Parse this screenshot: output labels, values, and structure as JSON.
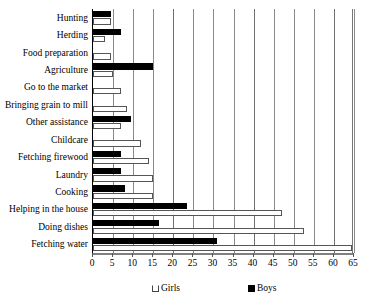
{
  "chart_data": {
    "type": "bar",
    "orientation": "horizontal",
    "title": "",
    "xlabel": "",
    "ylabel": "",
    "xlim": [
      0,
      65
    ],
    "xticks": [
      0,
      5,
      10,
      15,
      20,
      25,
      30,
      35,
      40,
      45,
      50,
      55,
      60,
      65
    ],
    "grid": true,
    "legend_position": "bottom",
    "categories": [
      "Hunting",
      "Herding",
      "Food preparation",
      "Agriculture",
      "Go to the market",
      "Bringing grain to mill",
      "Other assistance",
      "Childcare",
      "Fetching firewood",
      "Laundry",
      "Cooking",
      "Helping in the house",
      "Doing dishes",
      "Fetching water"
    ],
    "series": [
      {
        "name": "Girls",
        "color": "#ffffff",
        "values": [
          4.5,
          3,
          4.5,
          5,
          7,
          8.5,
          7,
          12,
          14,
          15,
          15,
          47,
          52.5,
          64.5
        ]
      },
      {
        "name": "Boys",
        "color": "#000000",
        "values": [
          4.5,
          7,
          0,
          15,
          0,
          0,
          9.5,
          0,
          7,
          7,
          8,
          23.5,
          16.5,
          31
        ]
      }
    ]
  },
  "legend": {
    "entries": [
      {
        "label": "Girls",
        "marker": "open-square-icon"
      },
      {
        "label": "Boys",
        "marker": "filled-square-icon"
      }
    ]
  }
}
